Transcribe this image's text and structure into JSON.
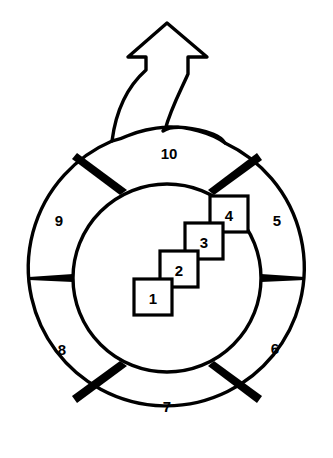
{
  "diagram": {
    "type": "cycle-with-breakout-arrow",
    "title": "",
    "background_color": "#ffffff",
    "line_color": "#000000",
    "fill_color": "#ffffff",
    "ring": {
      "name": "outer-ring",
      "segment_count": 6,
      "segments": [
        {
          "id": "segment-5",
          "label": "5",
          "cx": 277,
          "cy": 220
        },
        {
          "id": "segment-6",
          "label": "6",
          "cx": 275,
          "cy": 348
        },
        {
          "id": "segment-7",
          "label": "7",
          "cx": 167,
          "cy": 406
        },
        {
          "id": "segment-8",
          "label": "8",
          "cx": 62,
          "cy": 349
        },
        {
          "id": "segment-9",
          "label": "9",
          "cx": 59,
          "cy": 220
        },
        {
          "id": "segment-10",
          "label": "10",
          "cx": 169,
          "cy": 153
        }
      ]
    },
    "boxes": [
      {
        "id": "box-1",
        "label": "1",
        "x": 134,
        "y": 279,
        "w": 38,
        "h": 36
      },
      {
        "id": "box-2",
        "label": "2",
        "x": 160,
        "y": 251,
        "w": 38,
        "h": 36
      },
      {
        "id": "box-3",
        "label": "3",
        "x": 185,
        "y": 223,
        "w": 38,
        "h": 36
      },
      {
        "id": "box-4",
        "label": "4",
        "x": 210,
        "y": 196,
        "w": 38,
        "h": 36
      }
    ],
    "arrow": {
      "id": "breakout-arrow",
      "direction": "up",
      "label": "",
      "tip_x": 167,
      "tip_y": 23
    }
  }
}
